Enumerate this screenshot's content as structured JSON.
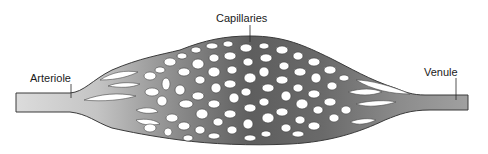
{
  "diagram": {
    "labels": {
      "capillaries": "Capillaries",
      "arteriole": "Arteriole",
      "venule": "Venule"
    },
    "colors": {
      "background": "#ffffff",
      "arteriole_fill": "#d6d6d6",
      "capillary_mid_fill": "#6e6e6e",
      "venule_fill": "#9a9a9a",
      "outline": "#3a3a3a",
      "label_text": "#1a1a1a"
    },
    "components": [
      {
        "name": "Arteriole",
        "side": "left",
        "role": "inflow vessel"
      },
      {
        "name": "Capillaries",
        "side": "center",
        "role": "capillary network"
      },
      {
        "name": "Venule",
        "side": "right",
        "role": "outflow vessel"
      }
    ]
  }
}
